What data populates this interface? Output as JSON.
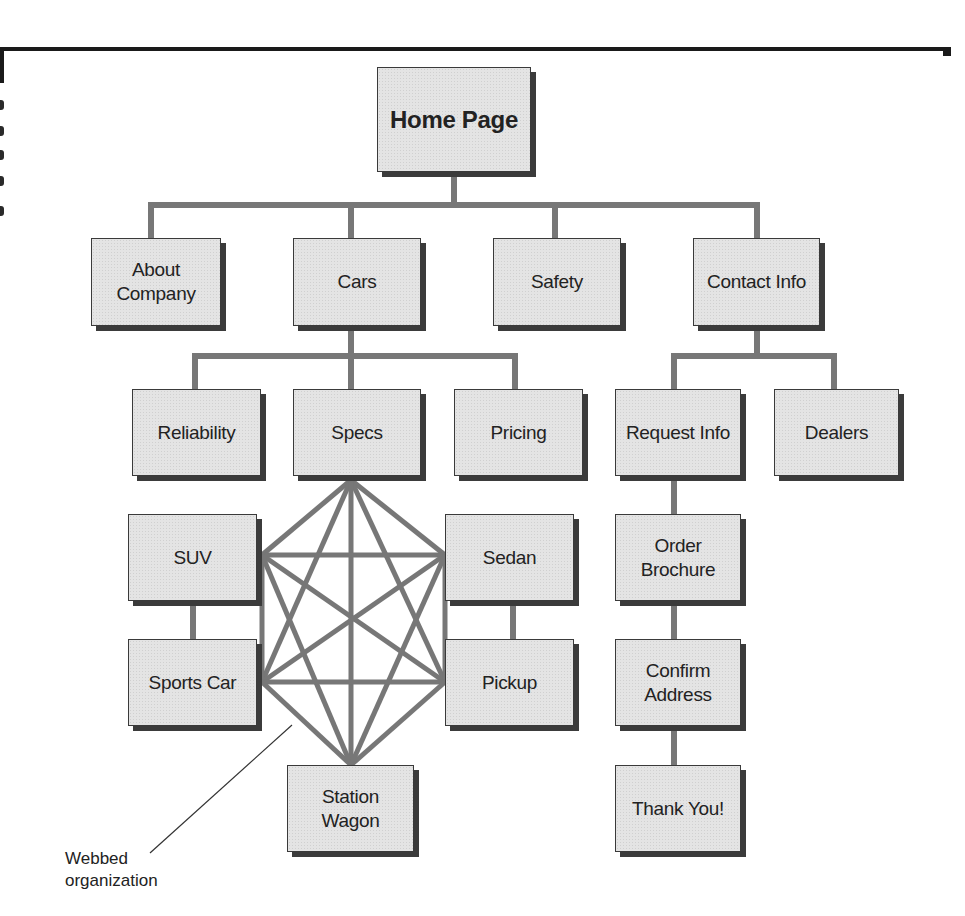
{
  "diagram": {
    "colors": {
      "box_fill": "#e4e4e4",
      "box_border": "#3a3a3a",
      "box_shadow": "#3b3b3b",
      "connector": "#777777",
      "text": "#222222"
    },
    "nodes": [
      {
        "id": "home",
        "label": "Home Page",
        "x": 377,
        "y": 67,
        "w": 154,
        "h": 105,
        "root": true
      },
      {
        "id": "about",
        "label": "About\nCompany",
        "x": 91,
        "y": 238,
        "w": 130,
        "h": 88
      },
      {
        "id": "cars",
        "label": "Cars",
        "x": 293,
        "y": 238,
        "w": 128,
        "h": 88
      },
      {
        "id": "safety",
        "label": "Safety",
        "x": 493,
        "y": 238,
        "w": 128,
        "h": 88
      },
      {
        "id": "contact",
        "label": "Contact Info",
        "x": 693,
        "y": 238,
        "w": 127,
        "h": 88
      },
      {
        "id": "reliability",
        "label": "Reliability",
        "x": 132,
        "y": 389,
        "w": 129,
        "h": 87
      },
      {
        "id": "specs",
        "label": "Specs",
        "x": 293,
        "y": 389,
        "w": 128,
        "h": 87
      },
      {
        "id": "pricing",
        "label": "Pricing",
        "x": 454,
        "y": 389,
        "w": 129,
        "h": 87
      },
      {
        "id": "request",
        "label": "Request Info",
        "x": 615,
        "y": 389,
        "w": 126,
        "h": 87
      },
      {
        "id": "dealers",
        "label": "Dealers",
        "x": 774,
        "y": 389,
        "w": 125,
        "h": 87
      },
      {
        "id": "suv",
        "label": "SUV",
        "x": 128,
        "y": 514,
        "w": 129,
        "h": 87
      },
      {
        "id": "sedan",
        "label": "Sedan",
        "x": 445,
        "y": 514,
        "w": 129,
        "h": 87
      },
      {
        "id": "sports",
        "label": "Sports Car",
        "x": 128,
        "y": 639,
        "w": 129,
        "h": 87
      },
      {
        "id": "pickup",
        "label": "Pickup",
        "x": 445,
        "y": 639,
        "w": 129,
        "h": 87
      },
      {
        "id": "wagon",
        "label": "Station\nWagon",
        "x": 287,
        "y": 765,
        "w": 127,
        "h": 87
      },
      {
        "id": "order",
        "label": "Order\nBrochure",
        "x": 615,
        "y": 514,
        "w": 126,
        "h": 87
      },
      {
        "id": "confirm",
        "label": "Confirm\nAddress",
        "x": 615,
        "y": 639,
        "w": 126,
        "h": 87
      },
      {
        "id": "thanks",
        "label": "Thank You!",
        "x": 615,
        "y": 765,
        "w": 126,
        "h": 87
      }
    ],
    "tree_connectors": [
      {
        "points": [
          [
            454,
            172
          ],
          [
            454,
            205
          ]
        ]
      },
      {
        "points": [
          [
            151,
            238
          ],
          [
            151,
            205
          ],
          [
            757,
            205
          ],
          [
            757,
            238
          ]
        ]
      },
      {
        "points": [
          [
            351,
            205
          ],
          [
            351,
            238
          ]
        ]
      },
      {
        "points": [
          [
            555,
            205
          ],
          [
            555,
            238
          ]
        ]
      },
      {
        "points": [
          [
            351,
            326
          ],
          [
            351,
            356
          ]
        ]
      },
      {
        "points": [
          [
            195,
            389
          ],
          [
            195,
            356
          ],
          [
            515,
            356
          ],
          [
            515,
            389
          ]
        ]
      },
      {
        "points": [
          [
            351,
            356
          ],
          [
            351,
            389
          ]
        ]
      },
      {
        "points": [
          [
            757,
            326
          ],
          [
            757,
            356
          ]
        ]
      },
      {
        "points": [
          [
            674,
            389
          ],
          [
            674,
            356
          ],
          [
            834,
            356
          ],
          [
            834,
            389
          ]
        ]
      },
      {
        "points": [
          [
            193,
            601
          ],
          [
            193,
            639
          ]
        ]
      },
      {
        "points": [
          [
            513,
            601
          ],
          [
            513,
            639
          ]
        ]
      },
      {
        "points": [
          [
            674,
            476
          ],
          [
            674,
            514
          ]
        ]
      },
      {
        "points": [
          [
            674,
            601
          ],
          [
            674,
            639
          ]
        ]
      },
      {
        "points": [
          [
            674,
            726
          ],
          [
            674,
            765
          ]
        ]
      }
    ],
    "web_nodes": {
      "specs": [
        351,
        480
      ],
      "suv": [
        262,
        555
      ],
      "sedan": [
        445,
        555
      ],
      "sports": [
        262,
        682
      ],
      "pickup": [
        445,
        682
      ],
      "wagon": [
        351,
        765
      ]
    },
    "web_edges": [
      [
        "specs",
        "suv"
      ],
      [
        "specs",
        "sedan"
      ],
      [
        "specs",
        "sports"
      ],
      [
        "specs",
        "pickup"
      ],
      [
        "specs",
        "wagon"
      ],
      [
        "suv",
        "sedan"
      ],
      [
        "suv",
        "sports"
      ],
      [
        "suv",
        "pickup"
      ],
      [
        "suv",
        "wagon"
      ],
      [
        "sedan",
        "sports"
      ],
      [
        "sedan",
        "pickup"
      ],
      [
        "sedan",
        "wagon"
      ],
      [
        "sports",
        "pickup"
      ],
      [
        "sports",
        "wagon"
      ],
      [
        "pickup",
        "wagon"
      ]
    ],
    "callout": {
      "label": "Webbed\norganization",
      "line": [
        [
          150,
          853
        ],
        [
          292,
          725
        ]
      ]
    },
    "page_edge_marks": [
      100,
      126,
      150,
      176,
      206
    ]
  }
}
